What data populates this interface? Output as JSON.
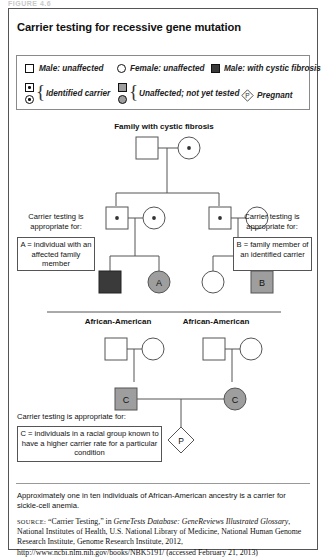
{
  "figure_label": "FIGURE 4.6",
  "title": "Carrier testing for recessive gene mutation",
  "legend": {
    "items": [
      {
        "key": "male_unaffected",
        "symbol": "square-outline",
        "label": "Male: unaffected"
      },
      {
        "key": "female_unaffected",
        "symbol": "circle-outline",
        "label": "Female: unaffected"
      },
      {
        "key": "male_affected",
        "symbol": "square-filled-black",
        "label": "Male: with cystic fibrosis"
      },
      {
        "key": "identified_carrier",
        "symbol": "square-dot-circle-dot",
        "label": "Identified carrier"
      },
      {
        "key": "not_yet_tested",
        "symbol": "square-gray-circle-gray",
        "label": "Unaffected; not yet tested"
      },
      {
        "key": "pregnant",
        "symbol": "diamond-p",
        "label": "Pregnant"
      }
    ]
  },
  "pedigree": {
    "heading": "Family with cystic fibrosis",
    "ethnicity_left": "African-American",
    "ethnicity_right": "African-American",
    "marks": {
      "a": "A",
      "b": "B",
      "c_left": "C",
      "c_right": "C",
      "pregnancy": "P"
    }
  },
  "annotations": {
    "left": {
      "lead_line1": "Carrier testing is",
      "lead_line2": "appropriate for:",
      "box": "A = individual with an affected family member"
    },
    "right": {
      "lead_line1": "Carrier testing is",
      "lead_line2": "appropriate for:",
      "box": "B = family member of an identified carrier"
    },
    "bottom": {
      "lead": "Carrier testing is appropriate for:",
      "box": "C = individuals in a racial group known to have a higher carrier rate for a particular condition"
    }
  },
  "footnote": "Approximately one in ten individuals of African-American ancestry is a carrier for sickle-cell anemia.",
  "source": {
    "label": "SOURCE:",
    "text_1": " “Carrier Testing,” in ",
    "italic_1": "GeneTests Database: GeneReviews Illustrated Glossary",
    "text_2": ", National Institutes of Health, U.S. National Library of Medicine, National Human Genome Research Institute, Genome Research Institute, 2012, http://www.ncbi.nlm.nih.gov/books/NBK5191/ (accessed February 21, 2013)"
  },
  "colors": {
    "affected_fill": "#3a3a3a",
    "carrier_gray": "#9e9e9e",
    "line": "#555555",
    "border": "#555555"
  }
}
